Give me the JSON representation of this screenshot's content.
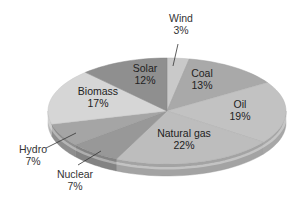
{
  "chart_data": {
    "type": "pie",
    "style": "3d-tilted",
    "title": "",
    "categories": [
      "Wind",
      "Coal",
      "Oil",
      "Natural gas",
      "Nuclear",
      "Hydro",
      "Biomass",
      "Solar"
    ],
    "values": [
      3,
      13,
      19,
      22,
      7,
      7,
      17,
      12
    ],
    "unit": "%",
    "start_angle_deg": 0,
    "direction": "clockwise",
    "slices": [
      {
        "label": "Wind",
        "value": 3,
        "pct_label": "3%",
        "color": "#c9c9c9",
        "label_pos": "outside",
        "lx": 181,
        "ly": 22
      },
      {
        "label": "Coal",
        "value": 13,
        "pct_label": "13%",
        "color": "#a9a9a9",
        "label_pos": "inside",
        "lx": 202,
        "ly": 77
      },
      {
        "label": "Oil",
        "value": 19,
        "pct_label": "19%",
        "color": "#c2c2c2",
        "label_pos": "inside",
        "lx": 240,
        "ly": 108
      },
      {
        "label": "Natural gas",
        "value": 22,
        "pct_label": "22%",
        "color": "#bdbdbd",
        "label_pos": "inside",
        "lx": 184,
        "ly": 137
      },
      {
        "label": "Nuclear",
        "value": 7,
        "pct_label": "7%",
        "color": "#989898",
        "label_pos": "outside",
        "lx": 75,
        "ly": 178
      },
      {
        "label": "Hydro",
        "value": 7,
        "pct_label": "7%",
        "color": "#a5a5a5",
        "label_pos": "outside",
        "lx": 33,
        "ly": 153
      },
      {
        "label": "Biomass",
        "value": 17,
        "pct_label": "17%",
        "color": "#d6d6d6",
        "label_pos": "inside",
        "lx": 98,
        "ly": 95
      },
      {
        "label": "Solar",
        "value": 12,
        "pct_label": "12%",
        "color": "#8f8f8f",
        "label_pos": "inside",
        "lx": 145,
        "ly": 72
      }
    ],
    "geometry": {
      "cx": 167,
      "cy": 111,
      "rx": 119,
      "ry": 53,
      "depth": 12
    },
    "legend": "none",
    "grid": false
  }
}
